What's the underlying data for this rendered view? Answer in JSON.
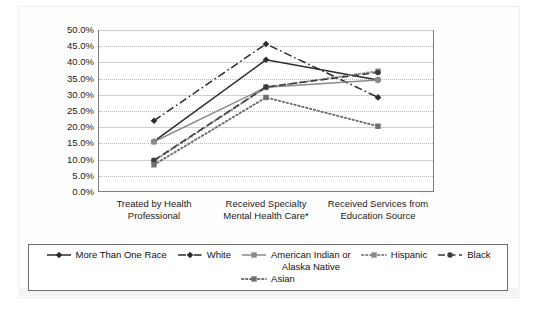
{
  "chart_data": {
    "type": "line",
    "title": "",
    "subtitle": "",
    "xlabel": "",
    "ylabel": "",
    "ylim": [
      0,
      50
    ],
    "ytick_labels": [
      "50.0%",
      "45.0%",
      "40.0%",
      "35.0%",
      "30.0%",
      "25.0%",
      "20.0%",
      "15.0%",
      "10.0%",
      "5.0%",
      "0.0%"
    ],
    "ytick_values": [
      50,
      45,
      40,
      35,
      30,
      25,
      20,
      15,
      10,
      5,
      0
    ],
    "grid": true,
    "legend_position": "bottom",
    "categories": [
      "Treated by Health Professional",
      "Received Specialty Mental Health Care*",
      "Received Services from Education Source"
    ],
    "category_lines": [
      [
        "Treated by Health",
        "Professional"
      ],
      [
        "Received Specialty",
        "Mental Health Care*"
      ],
      [
        "Received Services from",
        "Education Source"
      ]
    ],
    "series": [
      {
        "name": "More Than One Race",
        "values": [
          15.6,
          40.8,
          34.6
        ],
        "line_style": "solid",
        "marker": "diamond",
        "color": "#2b2b2b"
      },
      {
        "name": "White",
        "values": [
          22.0,
          45.7,
          29.2
        ],
        "line_style": "dash-dot",
        "marker": "diamond",
        "color": "#2b2b2b"
      },
      {
        "name": "American Indian or Alaska Native",
        "values": [
          15.5,
          32.3,
          34.6
        ],
        "line_style": "solid",
        "marker": "square",
        "color": "#8a8a8a"
      },
      {
        "name": "Hispanic",
        "values": [
          9.6,
          32.3,
          37.3
        ],
        "line_style": "dotted",
        "marker": "square",
        "color": "#8a8a8a"
      },
      {
        "name": "Black",
        "values": [
          9.8,
          32.4,
          36.9
        ],
        "line_style": "dashed",
        "marker": "circle",
        "color": "#3a3a3a"
      },
      {
        "name": "Asian",
        "values": [
          8.4,
          29.2,
          20.3
        ],
        "line_style": "dotted",
        "marker": "square",
        "color": "#6f6f6f"
      }
    ]
  },
  "legend": {
    "items": [
      {
        "label": "More Than One Race"
      },
      {
        "label": "White"
      },
      {
        "label": "American Indian or\nAlaska Native"
      },
      {
        "label": "Hispanic"
      },
      {
        "label": "Black"
      },
      {
        "label": "Asian"
      }
    ]
  }
}
